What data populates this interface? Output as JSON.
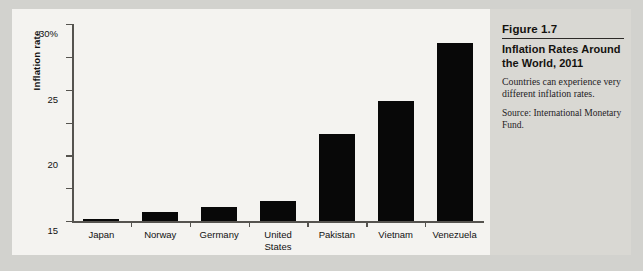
{
  "figure": {
    "number": "Figure 1.7",
    "title": "Inflation Rates Around the World, 2011",
    "description": "Countries can experience very different inflation rates.",
    "source": "Source: International Monetary Fund."
  },
  "colors": {
    "bar": "#080808",
    "axis": "#55534f",
    "page_background": "#d2d2ce",
    "chart_background": "#f4f3f0",
    "caption_background": "#d9d8d3"
  },
  "chart_data": {
    "type": "bar",
    "title": "Inflation Rates Around the World, 2011",
    "xlabel": "",
    "ylabel": "Inflation rate",
    "categories": [
      "Japan",
      "Norway",
      "Germany",
      "United States",
      "Pakistan",
      "Vietnam",
      "Venezuela"
    ],
    "values": [
      0.3,
      1.3,
      2.1,
      3.0,
      13.3,
      18.2,
      27.1
    ],
    "ylim": [
      0,
      30
    ],
    "yticks": [
      0,
      5,
      10,
      15,
      20,
      25,
      30
    ],
    "ytick_labels": [
      "0",
      "5",
      "10",
      "15",
      "20",
      "25",
      "30%"
    ],
    "grid": false,
    "legend": "none",
    "units": "percent"
  }
}
